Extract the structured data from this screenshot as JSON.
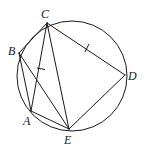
{
  "figure": {
    "type": "cyclic-geometry",
    "circle": {
      "cx": 72,
      "cy": 76,
      "r": 55
    },
    "points": [
      {
        "name": "C",
        "x": 47,
        "y": 23,
        "label_x": 41,
        "label_y": 18
      },
      {
        "name": "B",
        "x": 19,
        "y": 53,
        "label_x": 8,
        "label_y": 55
      },
      {
        "name": "A",
        "x": 31,
        "y": 111,
        "label_x": 23,
        "label_y": 125
      },
      {
        "name": "E",
        "x": 69,
        "y": 129,
        "label_x": 64,
        "label_y": 144
      },
      {
        "name": "D",
        "x": 125,
        "y": 75,
        "label_x": 128,
        "label_y": 80
      }
    ],
    "segments": [
      [
        "B",
        "C"
      ],
      [
        "C",
        "A"
      ],
      [
        "C",
        "E"
      ],
      [
        "C",
        "D"
      ],
      [
        "D",
        "E"
      ],
      [
        "B",
        "A"
      ],
      [
        "B",
        "E"
      ],
      [
        "A",
        "E"
      ]
    ],
    "equal_marks": [
      {
        "on": "CA",
        "x": 41,
        "y": 69
      },
      {
        "on": "CD",
        "x": 87,
        "y": 48
      }
    ],
    "labels": {
      "C": "C",
      "B": "B",
      "A": "A",
      "E": "E",
      "D": "D"
    }
  }
}
